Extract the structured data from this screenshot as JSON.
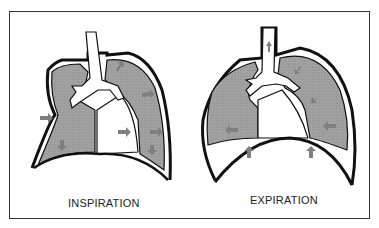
{
  "diagram": {
    "panels": [
      {
        "id": "inspiration",
        "label": "INSPIRATION",
        "arrows": "outward/downward (chest expands, diaphragm descends)"
      },
      {
        "id": "expiration",
        "label": "EXPIRATION",
        "arrows": "inward/upward (chest contracts, diaphragm rises, air exits trachea)"
      }
    ],
    "colors": {
      "lung_fill": "#9a9a9a",
      "arrow": "#808080",
      "outline": "#111111",
      "background": "#ffffff"
    }
  }
}
